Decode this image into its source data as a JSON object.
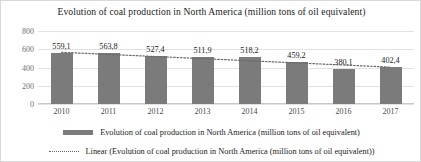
{
  "chart_data": {
    "type": "bar",
    "title": "Evolution of coal production in North America (million tons of oil equivalent)",
    "xlabel": "",
    "ylabel": "",
    "ylim": [
      0,
      800
    ],
    "yticks": [
      800,
      600,
      400,
      200,
      0
    ],
    "grid": true,
    "legend_position": "bottom",
    "categories": [
      "2010",
      "2011",
      "2012",
      "2013",
      "2014",
      "2015",
      "2016",
      "2017"
    ],
    "values": [
      559.1,
      563.8,
      527.4,
      511.9,
      518.2,
      459.2,
      380.1,
      402.4
    ],
    "value_labels": [
      "559,1",
      "563,8",
      "527,4",
      "511,9",
      "518,2",
      "459,2",
      "380,1",
      "402,4"
    ],
    "series": [
      {
        "name": "Evolution of coal production in North America (million tons of oil equivalent)",
        "type": "bar",
        "color": "#7b7b7b",
        "values": [
          559.1,
          563.8,
          527.4,
          511.9,
          518.2,
          459.2,
          380.1,
          402.4
        ]
      },
      {
        "name": "Linear (Evolution of coal production in North America (million tons of oil equivalent))",
        "type": "line",
        "style": "dotted",
        "color": "#6a6a6a",
        "values": [
          567.0,
          543.7,
          520.4,
          497.1,
          473.8,
          450.5,
          427.2,
          403.9
        ]
      }
    ],
    "legend": [
      {
        "label": "Evolution of coal production in North America (million tons of oil equivalent)",
        "marker": "bar-swatch"
      },
      {
        "label": "Linear (Evolution of coal production in North America (million tons of oil equivalent))",
        "marker": "dotted-line-swatch"
      }
    ]
  }
}
